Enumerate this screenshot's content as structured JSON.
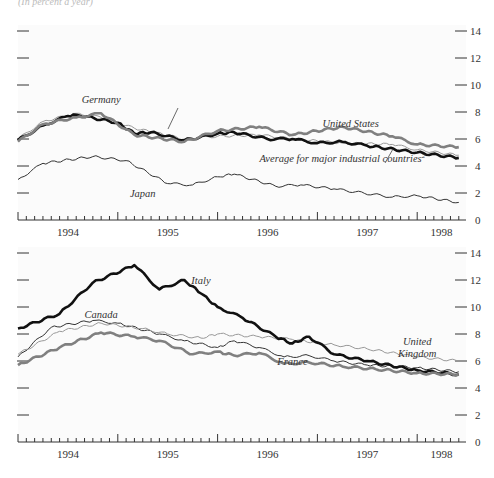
{
  "header": {
    "clipped_text": "(In percent a year)"
  },
  "chart_data": [
    {
      "type": "line",
      "title": "",
      "xlabel": "",
      "ylabel": "",
      "ylim": [
        0,
        14
      ],
      "yticks": [
        0,
        2,
        4,
        6,
        8,
        10,
        12,
        14
      ],
      "x_tick_labels": [
        "1994",
        "1995",
        "1996",
        "1997",
        "1998"
      ],
      "x_range": [
        "1994-01",
        "1998-06"
      ],
      "grid": false,
      "legend": "inline labels",
      "annotations": [
        {
          "text": "Germany",
          "x": "1994-11",
          "y": 8.7
        },
        {
          "text": "United States",
          "x": "1997-05",
          "y": 6.9
        },
        {
          "text": "Average for major industrial countries",
          "superscript": "2",
          "x": "1997-04",
          "y": 4.3
        },
        {
          "text": "Japan",
          "x": "1995-04",
          "y": 1.7
        }
      ],
      "series": [
        {
          "name": "Average for major industrial countries",
          "style": "thick-black",
          "x": [
            "1994-01",
            "1994-04",
            "1994-07",
            "1994-08",
            "1995-01",
            "1995-03",
            "1995-05",
            "1995-09",
            "1996-01",
            "1996-03",
            "1996-07",
            "1996-10",
            "1997-01",
            "1997-04",
            "1997-07",
            "1998-01",
            "1998-06"
          ],
          "values": [
            5.9,
            7.0,
            7.7,
            7.8,
            7.2,
            6.4,
            6.5,
            5.9,
            6.4,
            6.5,
            6.0,
            6.0,
            5.7,
            5.8,
            5.5,
            5.0,
            4.6
          ]
        },
        {
          "name": "United States",
          "style": "thick-gray",
          "x": [
            "1994-01",
            "1994-04",
            "1994-08",
            "1994-11",
            "1995-03",
            "1995-09",
            "1996-01",
            "1996-06",
            "1996-10",
            "1997-04",
            "1997-10",
            "1998-01",
            "1998-06"
          ],
          "values": [
            5.8,
            7.1,
            7.6,
            7.9,
            6.3,
            5.8,
            6.6,
            6.9,
            6.3,
            6.9,
            6.2,
            5.6,
            5.4
          ]
        },
        {
          "name": "Germany",
          "style": "thin-gray",
          "x": [
            "1994-01",
            "1994-04",
            "1994-08",
            "1994-11",
            "1995-03",
            "1995-09",
            "1996-01",
            "1996-06",
            "1996-10",
            "1997-04",
            "1997-10",
            "1998-01",
            "1998-06"
          ],
          "values": [
            6.0,
            7.3,
            7.9,
            7.6,
            6.8,
            6.0,
            6.2,
            6.3,
            6.0,
            5.7,
            5.6,
            5.2,
            4.8
          ]
        },
        {
          "name": "Japan",
          "style": "thin-black",
          "x": [
            "1994-01",
            "1994-04",
            "1994-10",
            "1995-02",
            "1995-07",
            "1995-10",
            "1996-01",
            "1996-03",
            "1996-08",
            "1996-11",
            "1997-03",
            "1997-10",
            "1998-01",
            "1998-06"
          ],
          "values": [
            3.0,
            4.2,
            4.7,
            4.4,
            2.7,
            2.6,
            3.2,
            3.4,
            2.5,
            2.6,
            2.3,
            1.7,
            1.8,
            1.3
          ]
        }
      ]
    },
    {
      "type": "line",
      "title": "",
      "xlabel": "",
      "ylabel": "",
      "ylim": [
        0,
        14
      ],
      "yticks": [
        0,
        2,
        4,
        6,
        8,
        10,
        12,
        14
      ],
      "x_tick_labels": [
        "1994",
        "1995",
        "1996",
        "1997",
        "1998"
      ],
      "x_range": [
        "1994-01",
        "1998-06"
      ],
      "grid": false,
      "legend": "inline labels",
      "annotations": [
        {
          "text": "Italy",
          "x": "1995-11",
          "y": 11.7
        },
        {
          "text": "Canada",
          "x": "1994-11",
          "y": 9.2
        },
        {
          "text": "United Kingdom",
          "x": "1998-01",
          "y": 7.2
        },
        {
          "text": "France",
          "x": "1996-10",
          "y": 5.7
        }
      ],
      "series": [
        {
          "name": "Italy",
          "style": "thick-black",
          "x": [
            "1994-01",
            "1994-06",
            "1994-10",
            "1995-03",
            "1995-06",
            "1995-09",
            "1995-11",
            "1996-01",
            "1996-04",
            "1996-08",
            "1996-10",
            "1996-12",
            "1997-03",
            "1997-07",
            "1998-01",
            "1998-06"
          ],
          "values": [
            8.4,
            9.5,
            11.8,
            13.1,
            11.3,
            12.0,
            11.0,
            10.0,
            9.2,
            7.8,
            7.3,
            7.8,
            6.5,
            6.0,
            5.3,
            5.0
          ]
        },
        {
          "name": "Canada",
          "style": "thin-black",
          "x": [
            "1994-01",
            "1994-05",
            "1994-10",
            "1995-01",
            "1995-06",
            "1995-09",
            "1996-01",
            "1996-03",
            "1996-06",
            "1996-09",
            "1996-12",
            "1997-03",
            "1997-07",
            "1998-01",
            "1998-06"
          ],
          "values": [
            6.3,
            8.5,
            9.0,
            8.8,
            8.0,
            7.5,
            7.0,
            7.5,
            7.0,
            6.3,
            6.4,
            6.0,
            5.7,
            5.5,
            5.2
          ]
        },
        {
          "name": "United Kingdom",
          "style": "thin-gray",
          "x": [
            "1994-01",
            "1994-06",
            "1994-11",
            "1995-04",
            "1995-07",
            "1995-11",
            "1996-01",
            "1996-06",
            "1996-10",
            "1997-03",
            "1997-07",
            "1998-01",
            "1998-06"
          ],
          "values": [
            6.5,
            8.2,
            8.8,
            8.4,
            8.0,
            7.7,
            8.0,
            7.8,
            7.6,
            7.2,
            6.9,
            6.3,
            6.0
          ]
        },
        {
          "name": "France",
          "style": "thick-gray",
          "x": [
            "1994-01",
            "1994-06",
            "1994-11",
            "1995-03",
            "1995-06",
            "1995-10",
            "1996-01",
            "1996-03",
            "1996-06",
            "1996-09",
            "1996-12",
            "1997-04",
            "1997-08",
            "1998-01",
            "1998-06"
          ],
          "values": [
            5.7,
            7.0,
            8.1,
            7.8,
            7.5,
            6.5,
            6.7,
            6.4,
            6.6,
            5.8,
            5.9,
            5.6,
            5.4,
            5.1,
            5.0
          ]
        }
      ]
    }
  ],
  "styles": {
    "thick-black": {
      "color": "#111111",
      "width": 2.6
    },
    "thick-gray": {
      "color": "#808080",
      "width": 2.6
    },
    "thin-black": {
      "color": "#333333",
      "width": 1.0
    },
    "thin-gray": {
      "color": "#999999",
      "width": 1.0
    }
  }
}
